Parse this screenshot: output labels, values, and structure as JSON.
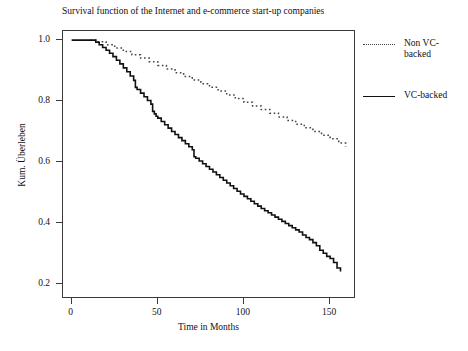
{
  "chart_data": {
    "type": "line",
    "title": "Survival function of the Internet and e-commerce start-up companies",
    "xlabel": "Time in Months",
    "ylabel": "Kum. Überleben",
    "xlim": [
      -5,
      165
    ],
    "ylim": [
      0.15,
      1.03
    ],
    "xticks": [
      0,
      50,
      100,
      150
    ],
    "xtick_labels": [
      "0",
      "50",
      "100",
      "150"
    ],
    "yticks": [
      0.2,
      0.4,
      0.6,
      0.8,
      1.0
    ],
    "ytick_labels": [
      "0.2",
      "0.4",
      "0.6",
      "0.8",
      "1.0"
    ],
    "grid": false,
    "legend_position": "right-outside",
    "series": [
      {
        "name": "Non VC-backed",
        "label_lines": [
          "Non VC-",
          "backed"
        ],
        "style": "dashed",
        "color": "#444444",
        "x": [
          11,
          15,
          20,
          25,
          30,
          35,
          40,
          45,
          50,
          55,
          60,
          65,
          70,
          75,
          80,
          85,
          90,
          95,
          100,
          105,
          110,
          115,
          120,
          125,
          130,
          135,
          140,
          145,
          150,
          155,
          159
        ],
        "y": [
          1.0,
          0.995,
          0.985,
          0.974,
          0.963,
          0.952,
          0.941,
          0.929,
          0.917,
          0.905,
          0.893,
          0.881,
          0.869,
          0.857,
          0.845,
          0.833,
          0.82,
          0.808,
          0.796,
          0.784,
          0.772,
          0.76,
          0.748,
          0.736,
          0.724,
          0.712,
          0.7,
          0.688,
          0.676,
          0.662,
          0.65
        ]
      },
      {
        "name": "VC-backed",
        "label_lines": [
          "VC-backed"
        ],
        "style": "solid",
        "color": "#111111",
        "x": [
          0,
          12,
          14,
          16,
          18,
          20,
          22,
          24,
          26,
          28,
          30,
          32,
          34,
          36,
          37,
          38,
          40,
          42,
          44,
          46,
          47,
          48,
          49,
          50,
          52,
          54,
          56,
          58,
          60,
          62,
          64,
          66,
          68,
          70,
          71,
          72,
          74,
          76,
          78,
          80,
          82,
          84,
          86,
          88,
          90,
          92,
          94,
          96,
          98,
          100,
          102,
          104,
          106,
          108,
          110,
          112,
          114,
          116,
          118,
          120,
          122,
          124,
          126,
          128,
          130,
          132,
          134,
          136,
          138,
          140,
          142,
          144,
          146,
          148,
          150,
          152,
          154,
          156
        ],
        "y": [
          1.0,
          1.0,
          0.993,
          0.985,
          0.976,
          0.967,
          0.957,
          0.946,
          0.934,
          0.922,
          0.909,
          0.896,
          0.882,
          0.868,
          0.845,
          0.838,
          0.826,
          0.814,
          0.802,
          0.79,
          0.766,
          0.758,
          0.75,
          0.744,
          0.733,
          0.722,
          0.711,
          0.7,
          0.69,
          0.68,
          0.67,
          0.66,
          0.65,
          0.64,
          0.617,
          0.612,
          0.603,
          0.594,
          0.585,
          0.576,
          0.567,
          0.558,
          0.549,
          0.54,
          0.531,
          0.522,
          0.513,
          0.504,
          0.495,
          0.487,
          0.479,
          0.471,
          0.463,
          0.455,
          0.447,
          0.44,
          0.433,
          0.426,
          0.419,
          0.412,
          0.405,
          0.398,
          0.391,
          0.384,
          0.377,
          0.37,
          0.36,
          0.352,
          0.345,
          0.335,
          0.325,
          0.31,
          0.3,
          0.29,
          0.283,
          0.27,
          0.252,
          0.24
        ]
      }
    ]
  }
}
